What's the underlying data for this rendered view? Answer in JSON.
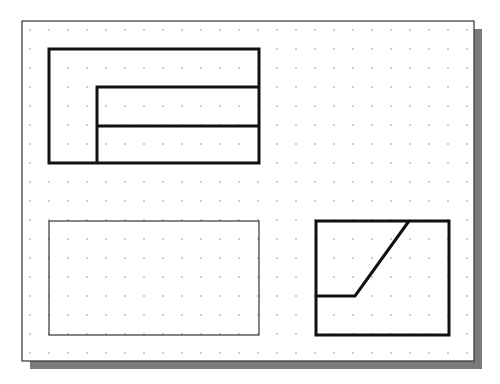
{
  "diagram": {
    "title": "",
    "sheet": {
      "x": 22,
      "y": 21,
      "width": 452,
      "height": 340,
      "border_color": "#333333",
      "fill": "#ffffff",
      "shadow": {
        "offset_x": 8,
        "offset_y": 8,
        "color": "#7a7a7a"
      }
    },
    "grid": {
      "origin_x": 30,
      "origin_y": 30,
      "spacing": 19,
      "cols": 24,
      "rows": 18,
      "dot_color": "#777777",
      "dot_radius": 0.7
    },
    "views": [
      {
        "name": "top-view",
        "stroke_width": 3,
        "color": "#111111",
        "shapes": [
          {
            "type": "rect",
            "x": 49,
            "y": 49,
            "w": 210,
            "h": 114
          },
          {
            "type": "polyline",
            "points": [
              [
                97,
                163
              ],
              [
                97,
                87
              ],
              [
                259,
                87
              ]
            ]
          },
          {
            "type": "line",
            "x1": 97,
            "y1": 126,
            "x2": 259,
            "y2": 126
          }
        ]
      },
      {
        "name": "front-view-empty",
        "stroke_width": 1.2,
        "color": "#333333",
        "shapes": [
          {
            "type": "rect",
            "x": 49,
            "y": 221,
            "w": 210,
            "h": 114
          }
        ]
      },
      {
        "name": "side-view",
        "stroke_width": 3,
        "color": "#111111",
        "shapes": [
          {
            "type": "rect",
            "x": 316,
            "y": 221,
            "w": 133,
            "h": 114
          },
          {
            "type": "polyline",
            "points": [
              [
                316,
                296
              ],
              [
                355,
                296
              ],
              [
                409,
                221
              ]
            ]
          }
        ]
      }
    ]
  }
}
